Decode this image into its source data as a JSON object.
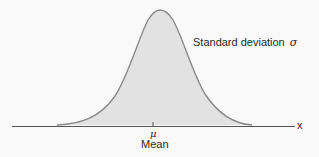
{
  "diagram": {
    "labels": {
      "std_dev_text": "Standard deviation",
      "std_dev_symbol": "σ",
      "axis_variable": "x",
      "mean_symbol": "μ",
      "mean_text": "Mean"
    },
    "colors": {
      "background": "#f9f9f9",
      "curve_fill": "#e2e2e2",
      "curve_stroke": "#8a8a8a",
      "axis": "#555555",
      "text": "#2a2a2a"
    },
    "curve": {
      "type": "normal",
      "peak_x_px": 160,
      "peak_y_px": 10,
      "left_tail_x_px": 57,
      "right_tail_x_px": 252,
      "baseline_y_px": 126
    },
    "axis": {
      "x_start_px": 12,
      "x_end_px": 295,
      "y_px": 126,
      "mean_tick_x_px": 153
    }
  }
}
